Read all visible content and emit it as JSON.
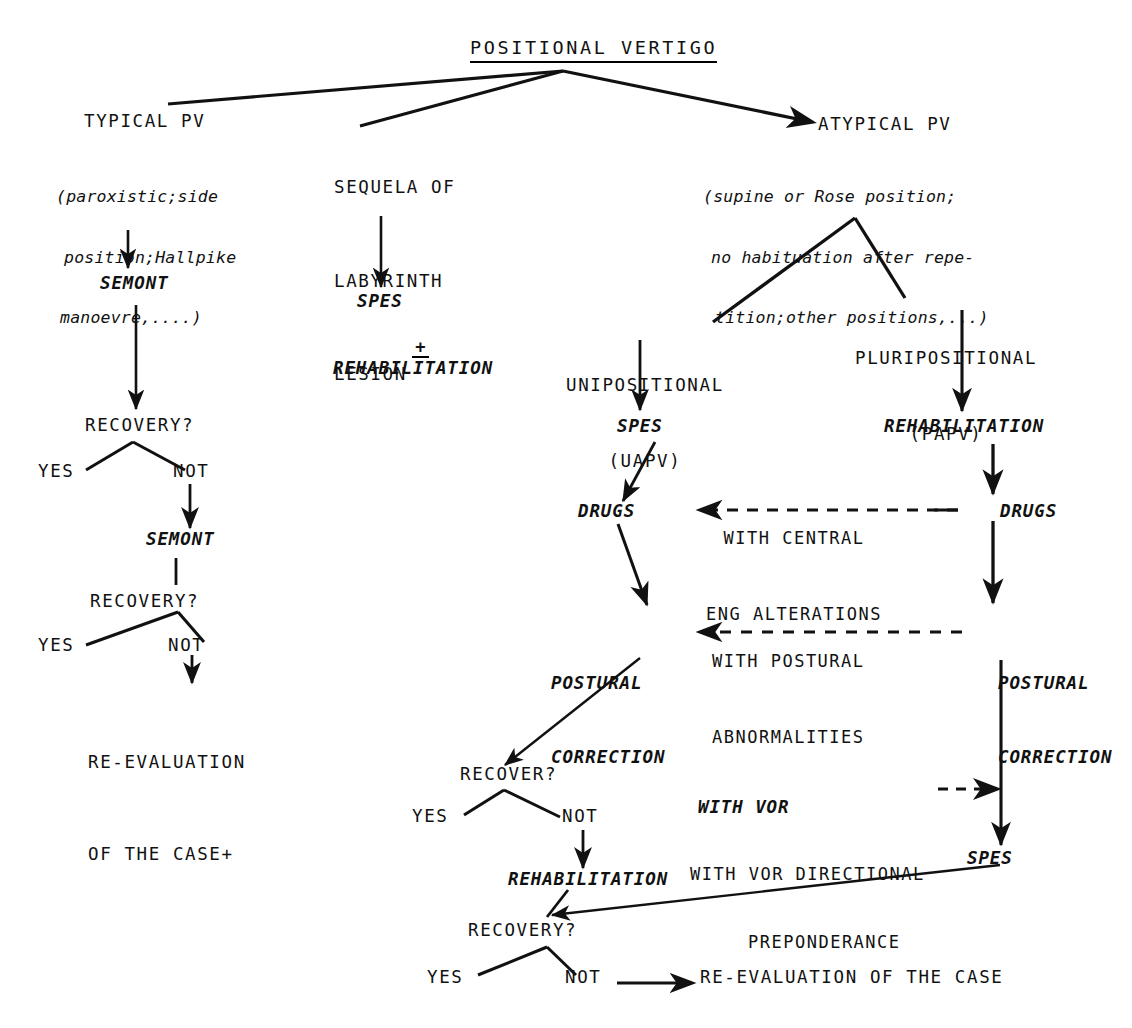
{
  "diagram": {
    "title": "POSITIONAL VERTIGO",
    "branches": {
      "typical": {
        "heading": "TYPICAL PV",
        "detail_lines": [
          "(paroxistic;side",
          "position;Hallpike",
          "manoevre,....)"
        ],
        "treatment_1": "SEMONT",
        "decision_1": "RECOVERY?",
        "decision_1_yes": "YES",
        "decision_1_not": "NOT",
        "treatment_2": "SEMONT",
        "decision_2": "RECOVERY?",
        "decision_2_yes": "YES",
        "decision_2_not": "NOT",
        "outcome_line_1": "RE-EVALUATION",
        "outcome_line_2": "OF THE CASE+"
      },
      "sequela": {
        "heading_line_1": "SEQUELA OF",
        "heading_line_2": "LABYRINTH",
        "heading_line_3": "LESION",
        "treatment_1": "SPES",
        "plus": "+",
        "treatment_2": "REHABILITATION"
      },
      "atypical": {
        "heading": "ATYPICAL PV",
        "detail_lines": [
          "(supine or Rose position;",
          "no habituation after repe-",
          "tition;other positions,...)"
        ],
        "unipositional_line_1": "UNIPOSITIONAL",
        "unipositional_line_2": "(UAPV)",
        "pluripositional_line_1": "PLURIPOSITIONAL",
        "pluripositional_line_2": "(PAPV)",
        "uni_treatment_1": "SPES",
        "pluri_treatment_1": "REHABILITATION",
        "uni_drugs": "DRUGS",
        "pluri_drugs": "DRUGS",
        "central_label_line_1": "WITH CENTRAL",
        "central_label_line_2": "ENG ALTERATIONS",
        "uni_postural_line_1": "POSTURAL",
        "uni_postural_line_2": "CORRECTION",
        "pluri_postural_line_1": "POSTURAL",
        "pluri_postural_line_2": "CORRECTION",
        "postural_label_line_1": "WITH POSTURAL",
        "postural_label_line_2": "ABNORMALITIES",
        "vor_label_line_1": "WITH VOR",
        "vor_label_line_2": "WITH VOR DIRECTIONAL",
        "vor_label_line_3": "PREPONDERANCE",
        "pluri_spes": "SPES",
        "decision_recover": "RECOVER?",
        "recover_yes": "YES",
        "recover_not": "NOT",
        "rehabilitation": "REHABILITATION",
        "decision_recovery": "RECOVERY?",
        "recovery_yes": "YES",
        "recovery_not": "NOT",
        "final_outcome": "RE-EVALUATION OF THE CASE"
      }
    },
    "colors": {
      "ink": "#111111",
      "paper": "#ffffff"
    }
  }
}
